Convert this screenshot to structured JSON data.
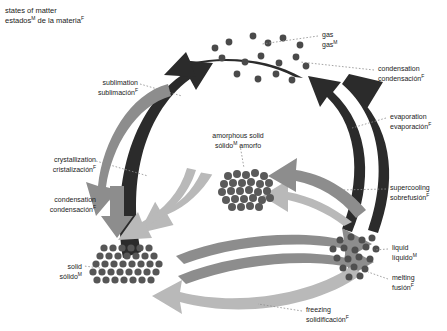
{
  "title": {
    "en": "states of matter",
    "es": "estados",
    "es_sup": "M",
    "es_rest": " de la materia",
    "es_rest_sup": "F"
  },
  "colors": {
    "arrow_dark": "#2b2b2b",
    "arrow_mid": "#8d8d8d",
    "arrow_light": "#b9b9b9",
    "molecule_dark": "#3a3a3a",
    "molecule_mid": "#6e6e6e",
    "leader_line": "#8d8d8d",
    "text": "#1a1a1a",
    "background": "#ffffff"
  },
  "states": [
    {
      "id": "gas",
      "en": "gas",
      "es": "gas",
      "es_sup": "M",
      "x": 322,
      "y": 30
    },
    {
      "id": "amorphous-solid",
      "en": "amorphous solid",
      "es": "sólido",
      "es_sup": "M",
      "es_rest": " amorfo",
      "x": 226,
      "y": 131
    },
    {
      "id": "liquid",
      "en": "liquid",
      "es": "líquido",
      "es_sup": "M",
      "x": 392,
      "y": 243
    },
    {
      "id": "solid",
      "en": "solid",
      "es": "sólido",
      "es_sup": "M",
      "x": 80,
      "y": 262
    }
  ],
  "transitions": [
    {
      "id": "sublimation",
      "en": "sublimation",
      "es": "sublimación",
      "es_sup": "F",
      "x": 88,
      "y": 78
    },
    {
      "id": "condensation-gas-to-solid",
      "en": "condensation",
      "es": "condensación",
      "es_sup": "F",
      "x": 378,
      "y": 64
    },
    {
      "id": "evaporation",
      "en": "evaporation",
      "es": "evaporación",
      "es_sup": "F",
      "x": 390,
      "y": 112
    },
    {
      "id": "crystallization",
      "en": "crystallization",
      "es": "cristalización",
      "es_sup": "F",
      "x": 24,
      "y": 155
    },
    {
      "id": "condensation-left",
      "en": "condensation",
      "es": "condensación",
      "es_sup": "F",
      "x": 24,
      "y": 195
    },
    {
      "id": "supercooling",
      "en": "supercooling",
      "es": "sobrefusión",
      "es_sup": "F",
      "x": 390,
      "y": 183
    },
    {
      "id": "melting",
      "en": "melting",
      "es": "fusión",
      "es_sup": "F",
      "x": 392,
      "y": 273
    },
    {
      "id": "freezing",
      "en": "freezing",
      "es": "solidificación",
      "es_sup": "F",
      "x": 306,
      "y": 305
    }
  ]
}
